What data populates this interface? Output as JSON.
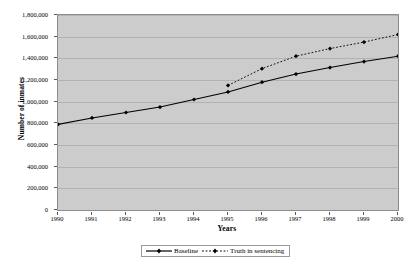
{
  "chart_data": {
    "type": "line",
    "title": "",
    "xlabel": "Years",
    "ylabel": "Number of inmates",
    "x": [
      1990,
      1991,
      1992,
      1993,
      1994,
      1995,
      1996,
      1997,
      1998,
      1999,
      2000
    ],
    "categories": [
      "1990",
      "1991",
      "1992",
      "1993",
      "1994",
      "1995",
      "1996",
      "1997",
      "1998",
      "1999",
      "2000"
    ],
    "xlim": [
      1990,
      2000
    ],
    "ylim": [
      0,
      1800000
    ],
    "ytick_values": [
      0,
      200000,
      400000,
      600000,
      800000,
      1000000,
      1200000,
      1400000,
      1600000,
      1800000
    ],
    "ytick_labels": [
      "0",
      "200,000",
      "400,000",
      "600,000",
      "800,000",
      "1,000,000",
      "1,200,000",
      "1,400,000",
      "1,600,000",
      "1,800,000"
    ],
    "grid": true,
    "grid_axis": "y",
    "legend_position": "bottom",
    "plot_background": "#cccccc",
    "series": [
      {
        "name": "Baseline",
        "line_style": "solid",
        "marker": "diamond",
        "color": "#000000",
        "values": [
          790000,
          850000,
          900000,
          950000,
          1020000,
          1090000,
          1180000,
          1255000,
          1315000,
          1370000,
          1420000
        ]
      },
      {
        "name": "Truth in sentencing",
        "line_style": "dotted",
        "marker": "diamond",
        "color": "#000000",
        "values": [
          null,
          null,
          null,
          null,
          null,
          1150000,
          1305000,
          1420000,
          1490000,
          1550000,
          1620000
        ]
      }
    ]
  },
  "axes": {
    "y_title": "Number of inmates",
    "x_title": "Years"
  },
  "legend": {
    "items": [
      {
        "label": "Baseline",
        "style": "solid"
      },
      {
        "label": "Truth in sentencing",
        "style": "dotted"
      }
    ]
  }
}
